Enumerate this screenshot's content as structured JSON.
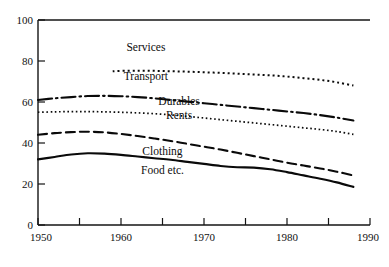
{
  "chart_data": {
    "type": "line",
    "title": "",
    "subtitle": "",
    "xlabel": "",
    "ylabel": "",
    "xlim": [
      1950,
      1990
    ],
    "ylim": [
      0,
      100
    ],
    "grid": false,
    "legend_position": "inline-labels",
    "x_ticks": [
      1950,
      1955,
      1960,
      1965,
      1970,
      1975,
      1980,
      1985,
      1990
    ],
    "x_tick_labels": [
      "1950",
      "",
      "1960",
      "",
      "1970",
      "",
      "1980",
      "",
      "1990"
    ],
    "y_ticks": [
      0,
      20,
      40,
      60,
      80,
      100
    ],
    "y_tick_labels": [
      "0",
      "20",
      "40",
      "60",
      "80",
      "100"
    ],
    "series": [
      {
        "name": "Services",
        "style": "dotted-square",
        "label": "Services",
        "label_x": 1963,
        "label_y": 85,
        "x": [
          1959,
          1960,
          1962,
          1964,
          1966,
          1968,
          1970,
          1972,
          1974,
          1976,
          1978,
          1980,
          1982,
          1984,
          1986,
          1988
        ],
        "values": [
          75.0,
          75.2,
          75.3,
          75.2,
          75.0,
          74.8,
          74.5,
          74.2,
          73.8,
          73.4,
          73.0,
          72.4,
          71.6,
          70.8,
          69.6,
          68.0
        ]
      },
      {
        "name": "Transport",
        "style": "label-only",
        "label": "Transport",
        "label_x": 1963,
        "label_y": 70.5,
        "x": [],
        "values": []
      },
      {
        "name": "Durables",
        "style": "dash-dot",
        "label": "Durables",
        "label_x": 1967,
        "label_y": 58.5,
        "x": [
          1950,
          1952,
          1954,
          1956,
          1958,
          1960,
          1962,
          1964,
          1966,
          1968,
          1970,
          1972,
          1974,
          1976,
          1978,
          1980,
          1982,
          1984,
          1986,
          1988
        ],
        "values": [
          61.0,
          61.8,
          62.4,
          62.9,
          63.0,
          62.8,
          62.4,
          61.8,
          61.0,
          60.2,
          59.4,
          58.6,
          57.8,
          57.0,
          56.2,
          55.4,
          54.6,
          53.6,
          52.4,
          51.0
        ]
      },
      {
        "name": "Rents",
        "style": "dotted-fine",
        "label": "Rents",
        "label_x": 1967,
        "label_y": 51.5,
        "x": [
          1950,
          1952,
          1954,
          1956,
          1958,
          1960,
          1962,
          1964,
          1966,
          1968,
          1970,
          1972,
          1974,
          1976,
          1978,
          1980,
          1982,
          1984,
          1986,
          1988
        ],
        "values": [
          55.0,
          55.2,
          55.3,
          55.3,
          55.2,
          55.0,
          54.7,
          54.3,
          53.7,
          53.0,
          52.2,
          51.4,
          50.6,
          49.8,
          49.0,
          48.2,
          47.4,
          46.6,
          45.6,
          44.2
        ]
      },
      {
        "name": "Clothing",
        "style": "dashed",
        "label": "Clothing",
        "label_x": 1965,
        "label_y": 34,
        "x": [
          1950,
          1952,
          1954,
          1956,
          1958,
          1960,
          1962,
          1964,
          1966,
          1968,
          1970,
          1972,
          1974,
          1976,
          1978,
          1980,
          1982,
          1984,
          1986,
          1988
        ],
        "values": [
          44.0,
          44.8,
          45.3,
          45.5,
          45.2,
          44.4,
          43.4,
          42.2,
          41.0,
          39.6,
          38.2,
          36.8,
          35.2,
          33.6,
          32.0,
          30.4,
          29.0,
          27.6,
          26.0,
          24.2
        ]
      },
      {
        "name": "Food etc.",
        "style": "solid",
        "label": "Food etc.",
        "label_x": 1965,
        "label_y": 25,
        "x": [
          1950,
          1952,
          1954,
          1956,
          1958,
          1960,
          1962,
          1964,
          1966,
          1968,
          1970,
          1972,
          1974,
          1976,
          1978,
          1980,
          1982,
          1984,
          1986,
          1988
        ],
        "values": [
          32.0,
          33.2,
          34.4,
          35.0,
          34.8,
          34.2,
          33.4,
          32.6,
          31.8,
          30.8,
          29.8,
          28.8,
          28.2,
          28.0,
          27.2,
          25.8,
          24.2,
          22.6,
          20.8,
          18.6
        ]
      }
    ]
  },
  "colors": {
    "ink": "#0a0a0a",
    "background": "#ffffff"
  }
}
